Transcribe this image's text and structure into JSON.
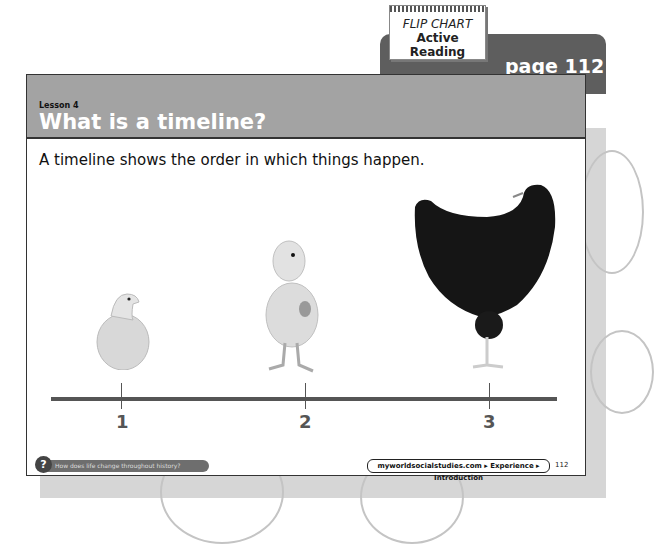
{
  "tab": {
    "flip_chart_title": "FLIP CHART",
    "flip_chart_subtitle": "Active Reading",
    "page_label": "page 112"
  },
  "header": {
    "lesson": "Lesson 4",
    "title": "What is a timeline?"
  },
  "intro": "A timeline shows the order in which things happen.",
  "timeline": {
    "points": [
      {
        "label": "1",
        "image": "chick hatching from egg"
      },
      {
        "label": "2",
        "image": "young chick"
      },
      {
        "label": "3",
        "image": "adult hen"
      }
    ]
  },
  "footer": {
    "question": "How does life change throughout history?",
    "link": "myworldsocialstudies.com ▸ Experience ▸ Introduction",
    "page_number": "112"
  }
}
